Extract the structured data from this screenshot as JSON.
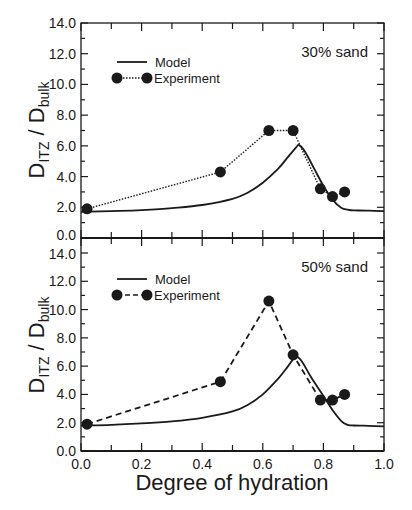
{
  "figure": {
    "ylabel_main": "D",
    "ylabel_sub1": "ITZ",
    "ylabel_sep": " / D",
    "ylabel_sub2": "bulk",
    "xlabel": "Degree of hydration"
  },
  "chart_data": [
    {
      "type": "line",
      "title": "30% sand",
      "xlabel": "Degree of hydration",
      "ylabel": "D_ITZ / D_bulk",
      "xlim": [
        0.0,
        1.0
      ],
      "ylim": [
        0.0,
        14.0
      ],
      "xticks": [
        "0.0",
        "0.2",
        "0.4",
        "0.6",
        "0.8",
        "1.0"
      ],
      "yticks": [
        "0.0",
        "2.0",
        "4.0",
        "6.0",
        "8.0",
        "10.0",
        "12.0",
        "14.0"
      ],
      "grid": false,
      "legend_position": "upper left",
      "series": [
        {
          "name": "Model",
          "style": "solid",
          "markers": false,
          "x": [
            0.0,
            0.1,
            0.2,
            0.3,
            0.4,
            0.5,
            0.55,
            0.6,
            0.65,
            0.68,
            0.71,
            0.72,
            0.74,
            0.77,
            0.8,
            0.83,
            0.86,
            0.88,
            0.9,
            0.95,
            1.0
          ],
          "y": [
            1.7,
            1.75,
            1.82,
            1.95,
            2.15,
            2.55,
            2.95,
            3.6,
            4.5,
            5.2,
            5.9,
            6.05,
            5.6,
            4.5,
            3.4,
            2.5,
            1.95,
            1.85,
            1.8,
            1.78,
            1.75
          ]
        },
        {
          "name": "Experiment",
          "style": "dotted",
          "markers": true,
          "x": [
            0.02,
            0.46,
            0.62,
            0.7,
            0.79,
            0.83,
            0.87
          ],
          "y": [
            1.9,
            4.3,
            7.0,
            7.0,
            3.2,
            2.7,
            3.0
          ]
        }
      ]
    },
    {
      "type": "line",
      "title": "50% sand",
      "xlabel": "Degree of hydration",
      "ylabel": "D_ITZ / D_bulk",
      "xlim": [
        0.0,
        1.0
      ],
      "ylim": [
        0.0,
        14.0
      ],
      "xticks": [
        "0.0",
        "0.2",
        "0.4",
        "0.6",
        "0.8",
        "1.0"
      ],
      "yticks": [
        "0.0",
        "2.0",
        "4.0",
        "6.0",
        "8.0",
        "10.0",
        "12.0",
        "14.0"
      ],
      "grid": false,
      "legend_position": "upper left",
      "series": [
        {
          "name": "Model",
          "style": "solid",
          "markers": false,
          "x": [
            0.0,
            0.1,
            0.2,
            0.3,
            0.4,
            0.5,
            0.55,
            0.6,
            0.65,
            0.68,
            0.7,
            0.71,
            0.73,
            0.76,
            0.8,
            0.83,
            0.86,
            0.88,
            0.9,
            0.95,
            1.0
          ],
          "y": [
            1.8,
            1.85,
            1.95,
            2.1,
            2.35,
            2.8,
            3.25,
            4.0,
            5.1,
            5.9,
            6.5,
            6.7,
            6.3,
            5.2,
            3.9,
            2.9,
            2.1,
            1.85,
            1.8,
            1.78,
            1.75
          ]
        },
        {
          "name": "Experiment",
          "style": "dashed",
          "markers": true,
          "x": [
            0.02,
            0.46,
            0.62,
            0.7,
            0.79,
            0.83,
            0.87
          ],
          "y": [
            1.9,
            4.9,
            10.6,
            6.8,
            3.6,
            3.6,
            4.0
          ]
        }
      ]
    }
  ]
}
